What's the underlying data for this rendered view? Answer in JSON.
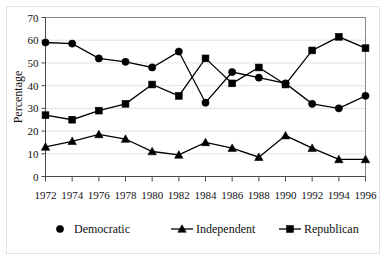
{
  "figure": {
    "title_fragment": "",
    "background": "#ffffff",
    "frame_color": "#e2e2e2"
  },
  "axes": {
    "ylabel": "Percentage",
    "yticks": [
      0,
      10,
      20,
      30,
      40,
      50,
      60,
      70
    ],
    "xticks": [
      "1972",
      "1974",
      "1976",
      "1978",
      "1980",
      "1982",
      "1984",
      "1986",
      "1988",
      "1990",
      "1992",
      "1994",
      "1996"
    ]
  },
  "legend": {
    "position": "bottom",
    "entries": [
      {
        "label": "Democratic",
        "marker": "circle",
        "color": "#000000"
      },
      {
        "label": "Independent",
        "marker": "triangle",
        "color": "#000000"
      },
      {
        "label": "Republican",
        "marker": "square",
        "color": "#000000"
      }
    ]
  },
  "chart_data": {
    "type": "line",
    "title": "",
    "xlabel": "",
    "ylabel": "Percentage",
    "ylim": [
      0,
      70
    ],
    "grid": true,
    "legend_position": "bottom",
    "categories": [
      "1972",
      "1974",
      "1976",
      "1978",
      "1980",
      "1982",
      "1984",
      "1986",
      "1988",
      "1990",
      "1992",
      "1994",
      "1996"
    ],
    "x": [
      1972,
      1974,
      1976,
      1978,
      1980,
      1982,
      1984,
      1986,
      1988,
      1990,
      1992,
      1994,
      1996
    ],
    "series": [
      {
        "name": "Democratic",
        "marker": "circle",
        "color": "#000000",
        "values": [
          59,
          58.5,
          52,
          50.5,
          48,
          55,
          32.5,
          46,
          43.5,
          41,
          32,
          30,
          35.5
        ]
      },
      {
        "name": "Independent",
        "marker": "triangle",
        "color": "#000000",
        "values": [
          13,
          15.5,
          18.5,
          16.5,
          11,
          9.5,
          15,
          12.5,
          8.5,
          18,
          12.5,
          7.5,
          7.5
        ]
      },
      {
        "name": "Republican",
        "marker": "square",
        "color": "#000000",
        "values": [
          27,
          25,
          29,
          32,
          40.5,
          35.5,
          52,
          41,
          48,
          40.5,
          55.5,
          61.5,
          56.5
        ]
      }
    ]
  }
}
